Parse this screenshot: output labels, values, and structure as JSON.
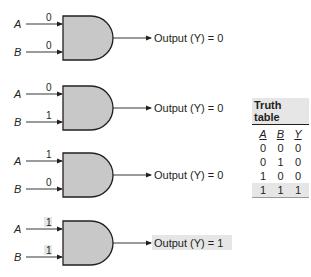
{
  "colors": {
    "gate_fill": "#c8c8c8",
    "stroke": "#231f20",
    "highlight": "#e6e6e6"
  },
  "gates": [
    {
      "input_a_label": "A",
      "input_b_label": "B",
      "a_value": "0",
      "b_value": "0",
      "output_text": "Output (Y) = 0",
      "highlighted": false
    },
    {
      "input_a_label": "A",
      "input_b_label": "B",
      "a_value": "0",
      "b_value": "1",
      "output_text": "Output (Y) = 0",
      "highlighted": false
    },
    {
      "input_a_label": "A",
      "input_b_label": "B",
      "a_value": "1",
      "b_value": "0",
      "output_text": "Output (Y) = 0",
      "highlighted": false
    },
    {
      "input_a_label": "A",
      "input_b_label": "B",
      "a_value": "1",
      "b_value": "1",
      "output_text": "Output (Y) = 1",
      "highlighted": true
    }
  ],
  "truth_table": {
    "title": "Truth table",
    "headers": [
      "A",
      "B",
      "Y"
    ],
    "rows": [
      [
        "0",
        "0",
        "0"
      ],
      [
        "0",
        "1",
        "0"
      ],
      [
        "1",
        "0",
        "0"
      ],
      [
        "1",
        "1",
        "1"
      ]
    ],
    "highlighted_row": 3
  }
}
